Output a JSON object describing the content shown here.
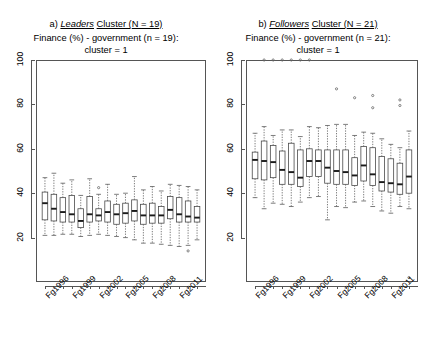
{
  "figure": {
    "width": 424,
    "height": 340,
    "background": "#ffffff",
    "line_color": "#555555",
    "median_color": "#1a1a1a"
  },
  "panels": [
    {
      "id": "a",
      "title_prefix": "a)",
      "title_emphasis": "Leaders",
      "title_suffix": "Cluster (N = 19)",
      "subtitle_line1": "Finance (%) - government (n = 19):",
      "subtitle_line2": "cluster = 1"
    },
    {
      "id": "b",
      "title_prefix": "b)",
      "title_emphasis": "Followers",
      "title_suffix": "Cluster (N = 21)",
      "subtitle_line1": "Finance (%) - government (n = 21):",
      "subtitle_line2": "cluster = 1"
    }
  ],
  "chart_data": [
    {
      "type": "box",
      "panel": "a",
      "title": "a) Leaders Cluster (N = 19)",
      "subtitle": "Finance (%) - government (n = 19): cluster = 1",
      "xlabel": "",
      "ylabel": "",
      "ylim": [
        0,
        100
      ],
      "yticks": [
        20,
        40,
        60,
        80,
        100
      ],
      "grid": false,
      "categories": [
        "Fg1996",
        "Fg1997",
        "Fg1998",
        "Fg1999",
        "Fg2000",
        "Fg2001",
        "Fg2002",
        "Fg2003",
        "Fg2004",
        "Fg2005",
        "Fg2006",
        "Fg2007",
        "Fg2008",
        "Fg2009",
        "Fg2010",
        "Fg2011",
        "Fg2012",
        "Fg2013"
      ],
      "tick_labels_shown": [
        "Fg1996",
        "Fg1999",
        "Fg2002",
        "Fg2005",
        "Fg2008",
        "Fg2011"
      ],
      "tick_label_interval": 3,
      "boxes": [
        {
          "category": "Fg1996",
          "whisker_low": 21.0,
          "q1": 28.0,
          "median": 35.5,
          "q3": 40.5,
          "whisker_high": 47.0,
          "outliers": []
        },
        {
          "category": "Fg1997",
          "whisker_low": 21.0,
          "q1": 27.5,
          "median": 33.0,
          "q3": 39.5,
          "whisker_high": 49.0,
          "outliers": []
        },
        {
          "category": "Fg1998",
          "whisker_low": 21.5,
          "q1": 27.0,
          "median": 31.5,
          "q3": 38.0,
          "whisker_high": 44.5,
          "outliers": []
        },
        {
          "category": "Fg1999",
          "whisker_low": 21.5,
          "q1": 27.0,
          "median": 30.5,
          "q3": 39.0,
          "whisker_high": 46.0,
          "outliers": []
        },
        {
          "category": "Fg2000",
          "whisker_low": 20.5,
          "q1": 24.5,
          "median": 27.5,
          "q3": 33.0,
          "whisker_high": 39.0,
          "outliers": []
        },
        {
          "category": "Fg2001",
          "whisker_low": 21.0,
          "q1": 27.0,
          "median": 30.5,
          "q3": 38.5,
          "whisker_high": 46.5,
          "outliers": []
        },
        {
          "category": "Fg2002",
          "whisker_low": 21.5,
          "q1": 27.5,
          "median": 30.0,
          "q3": 33.0,
          "whisker_high": 39.5,
          "outliers": [
            42.5
          ]
        },
        {
          "category": "Fg2003",
          "whisker_low": 21.0,
          "q1": 27.0,
          "median": 31.5,
          "q3": 36.5,
          "whisker_high": 44.0,
          "outliers": []
        },
        {
          "category": "Fg2004",
          "whisker_low": 20.5,
          "q1": 26.0,
          "median": 30.5,
          "q3": 35.0,
          "whisker_high": 39.5,
          "outliers": []
        },
        {
          "category": "Fg2005",
          "whisker_low": 20.0,
          "q1": 26.5,
          "median": 31.0,
          "q3": 35.5,
          "whisker_high": 40.0,
          "outliers": []
        },
        {
          "category": "Fg2006",
          "whisker_low": 19.0,
          "q1": 27.5,
          "median": 32.0,
          "q3": 37.0,
          "whisker_high": 47.5,
          "outliers": []
        },
        {
          "category": "Fg2007",
          "whisker_low": 17.5,
          "q1": 26.0,
          "median": 30.0,
          "q3": 35.0,
          "whisker_high": 41.5,
          "outliers": []
        },
        {
          "category": "Fg2008",
          "whisker_low": 17.5,
          "q1": 26.5,
          "median": 30.0,
          "q3": 35.5,
          "whisker_high": 43.0,
          "outliers": []
        },
        {
          "category": "Fg2009",
          "whisker_low": 17.0,
          "q1": 26.5,
          "median": 30.0,
          "q3": 34.0,
          "whisker_high": 41.0,
          "outliers": []
        },
        {
          "category": "Fg2010",
          "whisker_low": 16.5,
          "q1": 28.5,
          "median": 32.5,
          "q3": 38.5,
          "whisker_high": 44.0,
          "outliers": []
        },
        {
          "category": "Fg2011",
          "whisker_low": 16.0,
          "q1": 27.0,
          "median": 30.5,
          "q3": 38.0,
          "whisker_high": 43.5,
          "outliers": []
        },
        {
          "category": "Fg2012",
          "whisker_low": 16.5,
          "q1": 27.0,
          "median": 29.5,
          "q3": 36.5,
          "whisker_high": 43.0,
          "outliers": [
            14.0
          ]
        },
        {
          "category": "Fg2013",
          "whisker_low": 19.0,
          "q1": 27.0,
          "median": 29.0,
          "q3": 34.0,
          "whisker_high": 41.5,
          "outliers": []
        }
      ]
    },
    {
      "type": "box",
      "panel": "b",
      "title": "b) Followers Cluster (N = 21)",
      "subtitle": "Finance (%) - government (n = 21): cluster = 1",
      "xlabel": "",
      "ylabel": "",
      "ylim": [
        0,
        100
      ],
      "yticks": [
        20,
        40,
        60,
        80,
        100
      ],
      "grid": false,
      "categories": [
        "Fg1996",
        "Fg1997",
        "Fg1998",
        "Fg1999",
        "Fg2000",
        "Fg2001",
        "Fg2002",
        "Fg2003",
        "Fg2004",
        "Fg2005",
        "Fg2006",
        "Fg2007",
        "Fg2008",
        "Fg2009",
        "Fg2010",
        "Fg2011",
        "Fg2012",
        "Fg2013"
      ],
      "tick_labels_shown": [
        "Fg1996",
        "Fg1999",
        "Fg2002",
        "Fg2005",
        "Fg2008",
        "Fg2011"
      ],
      "tick_label_interval": 3,
      "boxes": [
        {
          "category": "Fg1996",
          "whisker_low": 38.0,
          "q1": 46.5,
          "median": 55.0,
          "q3": 58.5,
          "whisker_high": 67.0,
          "outliers": []
        },
        {
          "category": "Fg1997",
          "whisker_low": 33.0,
          "q1": 46.0,
          "median": 54.5,
          "q3": 63.5,
          "whisker_high": 70.0,
          "outliers": [
            100.0
          ]
        },
        {
          "category": "Fg1998",
          "whisker_low": 35.5,
          "q1": 47.0,
          "median": 54.0,
          "q3": 61.5,
          "whisker_high": 66.0,
          "outliers": [
            100.0
          ]
        },
        {
          "category": "Fg1999",
          "whisker_low": 35.0,
          "q1": 44.0,
          "median": 50.5,
          "q3": 59.0,
          "whisker_high": 68.5,
          "outliers": [
            100.0
          ]
        },
        {
          "category": "Fg2000",
          "whisker_low": 34.0,
          "q1": 44.0,
          "median": 49.5,
          "q3": 62.5,
          "whisker_high": 68.5,
          "outliers": [
            100.0
          ]
        },
        {
          "category": "Fg2001",
          "whisker_low": 36.0,
          "q1": 43.0,
          "median": 47.0,
          "q3": 59.5,
          "whisker_high": 65.5,
          "outliers": [
            100.0
          ]
        },
        {
          "category": "Fg2002",
          "whisker_low": 38.0,
          "q1": 47.5,
          "median": 54.5,
          "q3": 60.0,
          "whisker_high": 70.0,
          "outliers": [
            100.0
          ]
        },
        {
          "category": "Fg2003",
          "whisker_low": 38.5,
          "q1": 47.5,
          "median": 54.5,
          "q3": 59.5,
          "whisker_high": 69.5,
          "outliers": []
        },
        {
          "category": "Fg2004",
          "whisker_low": 28.0,
          "q1": 44.5,
          "median": 51.5,
          "q3": 59.5,
          "whisker_high": 70.5,
          "outliers": []
        },
        {
          "category": "Fg2005",
          "whisker_low": 34.0,
          "q1": 44.0,
          "median": 50.0,
          "q3": 59.5,
          "whisker_high": 71.0,
          "outliers": [
            87.0
          ]
        },
        {
          "category": "Fg2006",
          "whisker_low": 33.5,
          "q1": 44.0,
          "median": 49.5,
          "q3": 59.5,
          "whisker_high": 71.0,
          "outliers": []
        },
        {
          "category": "Fg2007",
          "whisker_low": 36.0,
          "q1": 43.5,
          "median": 48.0,
          "q3": 56.0,
          "whisker_high": 66.0,
          "outliers": [
            83.0
          ]
        },
        {
          "category": "Fg2008",
          "whisker_low": 36.5,
          "q1": 45.5,
          "median": 52.5,
          "q3": 61.0,
          "whisker_high": 67.5,
          "outliers": []
        },
        {
          "category": "Fg2009",
          "whisker_low": 34.0,
          "q1": 43.5,
          "median": 48.5,
          "q3": 60.5,
          "whisker_high": 67.0,
          "outliers": [
            78.5,
            84.0
          ]
        },
        {
          "category": "Fg2010",
          "whisker_low": 32.0,
          "q1": 41.0,
          "median": 45.0,
          "q3": 56.5,
          "whisker_high": 64.5,
          "outliers": []
        },
        {
          "category": "Fg2011",
          "whisker_low": 31.0,
          "q1": 40.5,
          "median": 44.5,
          "q3": 55.5,
          "whisker_high": 62.0,
          "outliers": []
        },
        {
          "category": "Fg2012",
          "whisker_low": 34.0,
          "q1": 39.5,
          "median": 44.0,
          "q3": 53.5,
          "whisker_high": 60.5,
          "outliers": [
            79.5,
            82.0
          ]
        },
        {
          "category": "Fg2013",
          "whisker_low": 33.0,
          "q1": 40.0,
          "median": 47.5,
          "q3": 59.5,
          "whisker_high": 68.0,
          "outliers": [
            2.0
          ]
        }
      ]
    }
  ]
}
